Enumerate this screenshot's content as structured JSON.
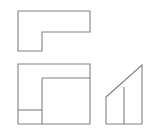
{
  "figure": {
    "background_color": "#ffffff",
    "line_color": "#808080",
    "line_width": 1.1,
    "canvas": {
      "width": 157,
      "height": 135
    }
  },
  "views": [
    {
      "id": "top-view",
      "name": "L-shaped top view",
      "shape": "l-polygon",
      "stroke": "#808080",
      "outline_points": "18,11 90,11 90,32 42,32 42,51 18,51",
      "internal_edges": []
    },
    {
      "id": "front-view",
      "name": "Front view rectangle with internal edges",
      "shape": "rectangle-with-edges",
      "stroke": "#808080",
      "outline_points": "18,64 90,64 90,124 18,124",
      "internal_edges": [
        {
          "name": "upper-step-edge",
          "d": "M 42 78 L 90 78"
        },
        {
          "name": "vertical-step-edge",
          "d": "M 42 78 L 42 124"
        },
        {
          "name": "lower-shelf-edge",
          "d": "M 18 110 L 42 110"
        }
      ]
    },
    {
      "id": "side-view",
      "name": "Side view ramp triangle",
      "shape": "ramp-polygon",
      "stroke": "#808080",
      "outline_points": "106,97 142,65 142,124 106,124",
      "internal_edges": [
        {
          "name": "ramp-division-edge",
          "d": "M 124 87 L 124 124"
        }
      ]
    }
  ]
}
